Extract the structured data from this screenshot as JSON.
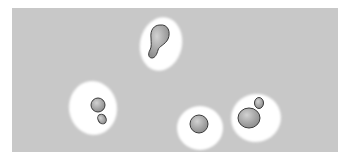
{
  "figure": {
    "colors": {
      "background": "#c8c8c8",
      "capsule": "#ffffff",
      "cell_fill": "#a9a9a9",
      "cell_highlight": "#cfcfcf",
      "cell_outline": "#3a3a3a"
    },
    "cells": [
      {
        "id": "top",
        "description": "elongated budding cell in capsule"
      },
      {
        "id": "left",
        "description": "cell with small bud in capsule"
      },
      {
        "id": "middle",
        "description": "single round cell in capsule"
      },
      {
        "id": "right",
        "description": "large cell with bud in capsule"
      }
    ]
  }
}
